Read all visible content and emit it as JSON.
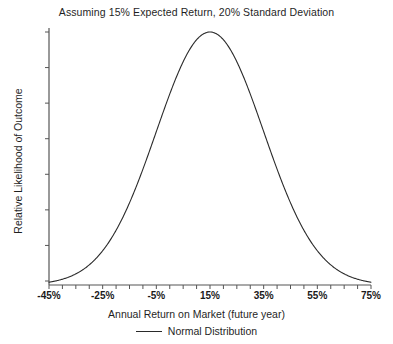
{
  "chart_data": {
    "type": "line",
    "title": "Assuming 15% Expected Return, 20% Standard Deviation",
    "xlabel": "Annual Return on Market (future year)",
    "ylabel": "Relative Likelihood of Outcome",
    "legend": [
      {
        "name": "Normal Distribution",
        "color": "#2a2a2a"
      }
    ],
    "legend_position": "bottom-center",
    "grid": false,
    "xlim": [
      -45,
      75
    ],
    "ylim": [
      0,
      1
    ],
    "x_tick_labels": [
      "-45%",
      "-25%",
      "-5%",
      "15%",
      "35%",
      "55%",
      "75%"
    ],
    "x_tick_values": [
      -45,
      -25,
      -5,
      15,
      35,
      55,
      75
    ],
    "x_minor_tick_step": 5,
    "y_tick_labels": [],
    "y_tick_count": 8,
    "distribution": {
      "mean": 15,
      "std_dev": 20,
      "expected_return_pct": "15%",
      "standard_deviation_pct": "20%"
    },
    "series": [
      {
        "name": "Normal Distribution",
        "x": [
          -45,
          -42,
          -39,
          -36,
          -33,
          -30,
          -27,
          -24,
          -21,
          -18,
          -15,
          -12,
          -9,
          -6,
          -3,
          0,
          3,
          6,
          9,
          12,
          15,
          18,
          21,
          24,
          27,
          30,
          33,
          36,
          39,
          42,
          45,
          48,
          51,
          54,
          57,
          60,
          63,
          66,
          69,
          72,
          75
        ],
        "values": [
          0.011,
          0.017,
          0.026,
          0.037,
          0.053,
          0.074,
          0.1,
          0.133,
          0.174,
          0.222,
          0.278,
          0.34,
          0.407,
          0.477,
          0.548,
          0.661,
          0.726,
          0.835,
          0.912,
          0.964,
          1.0,
          0.964,
          0.912,
          0.835,
          0.726,
          0.661,
          0.548,
          0.477,
          0.407,
          0.34,
          0.278,
          0.222,
          0.174,
          0.133,
          0.1,
          0.074,
          0.053,
          0.037,
          0.026,
          0.017,
          0.011
        ]
      }
    ]
  },
  "colors": {
    "background": "#ffffff",
    "axis": "#555555",
    "curve": "#2a2a2a",
    "text": "#1a1a1a"
  }
}
